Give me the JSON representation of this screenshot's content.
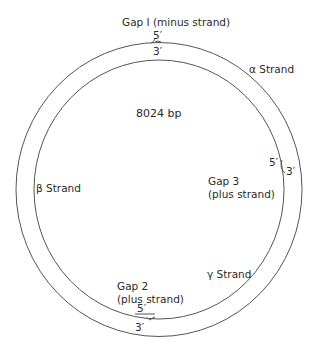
{
  "diagram": {
    "size_label": "8024 bp",
    "gaps": [
      {
        "name": "Gap I",
        "strand": "(minus strand)",
        "label": "Gap I (minus strand)",
        "five_prime": "5′",
        "three_prime": "3′"
      },
      {
        "name": "Gap 2",
        "strand": "(plus strand)",
        "five_prime": "5′",
        "three_prime": "3′"
      },
      {
        "name": "Gap 3",
        "strand": "(plus strand)",
        "five_prime": "5′",
        "three_prime": "3′"
      }
    ],
    "strands": [
      {
        "label": "α Strand"
      },
      {
        "label": "β Strand"
      },
      {
        "label": "γ Strand"
      }
    ],
    "colors": {
      "line": "#555555",
      "text": "#2a2a2a",
      "background": "#ffffff"
    }
  }
}
